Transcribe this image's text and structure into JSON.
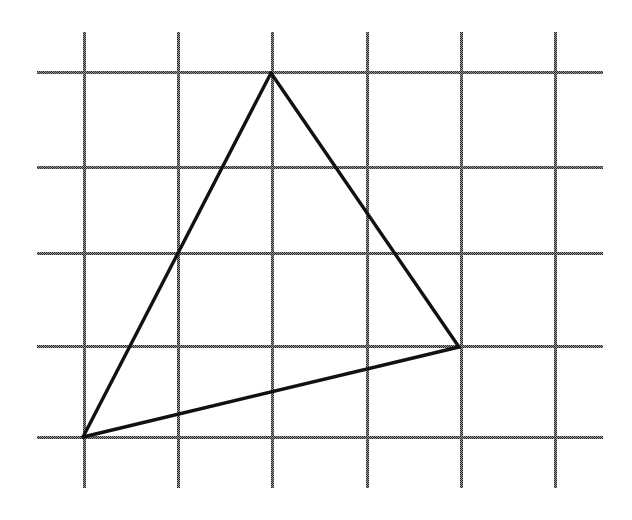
{
  "diagram": {
    "type": "triangle-on-grid",
    "canvas": {
      "width": 632,
      "height": 520,
      "background": "#ffffff"
    },
    "grid": {
      "columns": 6,
      "rows": 5,
      "vertical_x": [
        84,
        178,
        272,
        367,
        461,
        555
      ],
      "horizontal_y": [
        72,
        167,
        253,
        346,
        437
      ],
      "vertical_extent": [
        32,
        488
      ],
      "horizontal_extent": [
        37,
        603
      ],
      "line_color": "#555555",
      "line_style": "dotted-checker"
    },
    "triangle": {
      "vertices": [
        {
          "name": "top",
          "grid": [
            2,
            0
          ],
          "x": 271,
          "y": 73
        },
        {
          "name": "right",
          "grid": [
            4,
            3
          ],
          "x": 459,
          "y": 347
        },
        {
          "name": "bottom-left",
          "grid": [
            0,
            4
          ],
          "x": 83,
          "y": 437
        }
      ],
      "stroke_color": "#111111"
    }
  }
}
